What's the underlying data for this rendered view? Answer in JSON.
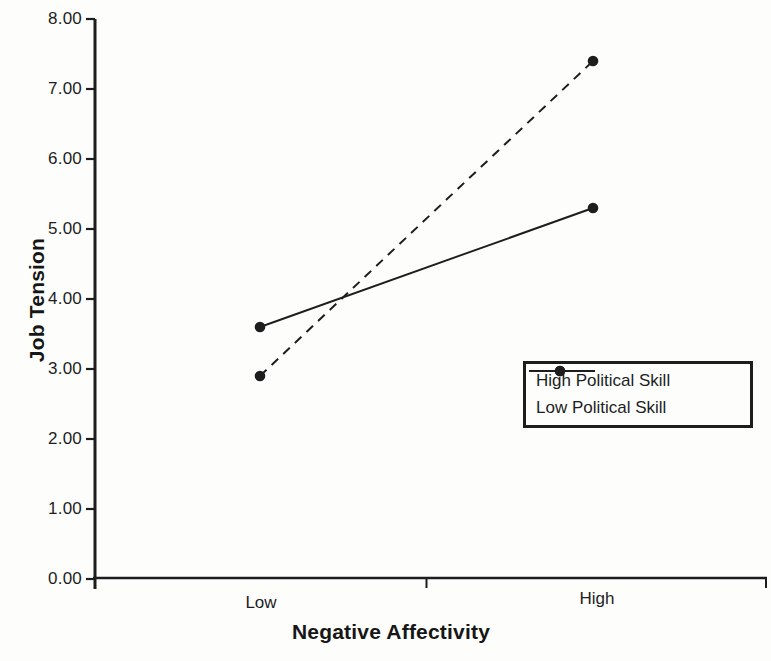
{
  "figure": {
    "background": "#fdfdfc",
    "ink_color": "#1d1d1d"
  },
  "chart_data": {
    "type": "line",
    "title": "",
    "xlabel": "Negative Affectivity",
    "ylabel": "Job Tension",
    "categories": [
      "Low",
      "High"
    ],
    "series": [
      {
        "name": "High Political Skill",
        "line_style": "solid",
        "marker": "filled-circle",
        "values": [
          3.6,
          5.3
        ]
      },
      {
        "name": "Low Political Skill",
        "line_style": "dashed",
        "marker": "filled-circle",
        "values": [
          2.9,
          7.4
        ]
      }
    ],
    "ylim": [
      0,
      8
    ],
    "ytick_step": 1,
    "yticks": [
      "0.00",
      "1.00",
      "2.00",
      "3.00",
      "4.00",
      "5.00",
      "6.00",
      "7.00",
      "8.00"
    ],
    "grid": false,
    "legend": {
      "position": "right-middle",
      "entries": [
        "High Political Skill",
        "Low Political Skill"
      ]
    }
  }
}
